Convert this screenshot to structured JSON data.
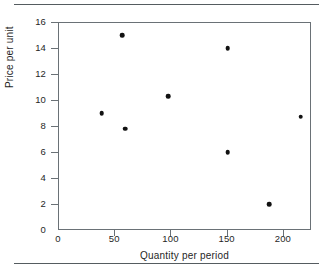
{
  "chart_data": {
    "type": "scatter",
    "title": "",
    "xlabel": "Quantity per period",
    "ylabel": "Price per unit",
    "xlim": [
      0,
      225
    ],
    "ylim": [
      0,
      16
    ],
    "xticks": [
      0,
      50,
      100,
      150,
      200
    ],
    "yticks": [
      0,
      2,
      4,
      6,
      8,
      10,
      12,
      14,
      16
    ],
    "xtick_labels": [
      "0",
      "50",
      "100",
      "150",
      "200"
    ],
    "ytick_labels": [
      "0",
      "2",
      "4",
      "6",
      "8",
      "10",
      "12",
      "14",
      "16"
    ],
    "grid": false,
    "legend": null,
    "marker": "filled-circle",
    "marker_color": "#121212",
    "axis_color": "#6a7176",
    "points": [
      {
        "x": 39,
        "y": 9.0
      },
      {
        "x": 57,
        "y": 15.0
      },
      {
        "x": 60,
        "y": 7.8
      },
      {
        "x": 98,
        "y": 10.3
      },
      {
        "x": 151,
        "y": 14.0
      },
      {
        "x": 151,
        "y": 6.0
      },
      {
        "x": 188,
        "y": 2.0
      },
      {
        "x": 216,
        "y": 8.7
      }
    ]
  },
  "figure": {
    "top_rule": "horizontal-rule",
    "bottom_rule": "horizontal-rule"
  }
}
